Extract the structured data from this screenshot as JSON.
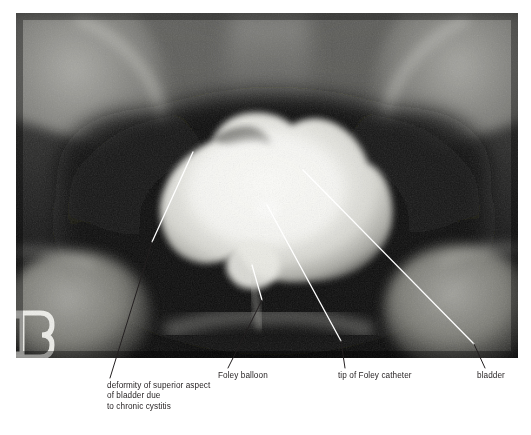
{
  "figure": {
    "kind": "annotated-radiograph",
    "modality": "cystogram",
    "background_color": "#ffffff",
    "text_color": "#231f20",
    "leader_line_color": "#ffffff",
    "leader_line_color_on_white": "#231f20"
  },
  "radiograph": {
    "alt": "Anteroposterior pelvic radiograph showing a contrast-filled urinary bladder with a Foley catheter in place",
    "film_background": "#101010",
    "contrast_bright": "#f4f4f0",
    "bone_tone": "#9a9a96",
    "soft_tissue_tone": "#4a4a48",
    "marker": {
      "name": "radiopaque-side-marker",
      "visible_text": ""
    }
  },
  "annotations": [
    {
      "id": "deformity",
      "name": "deformity-of-superior-aspect",
      "lines": [
        "deformity of superior aspect",
        "of bladder due",
        "to chronic cystitis"
      ],
      "text": "deformity of superior aspect\nof bladder due\nto chronic cystitis",
      "points_to": "superior bladder wall"
    },
    {
      "id": "balloon",
      "name": "foley-balloon",
      "lines": [
        "Foley balloon"
      ],
      "text": "Foley balloon",
      "points_to": "balloon at bladder base"
    },
    {
      "id": "tip",
      "name": "tip-of-foley-catheter",
      "lines": [
        "tip of Foley catheter"
      ],
      "text": "tip of Foley catheter",
      "points_to": "catheter tip within bladder"
    },
    {
      "id": "bladder",
      "name": "bladder",
      "lines": [
        "bladder"
      ],
      "text": "bladder",
      "points_to": "right lateral bladder margin"
    }
  ]
}
